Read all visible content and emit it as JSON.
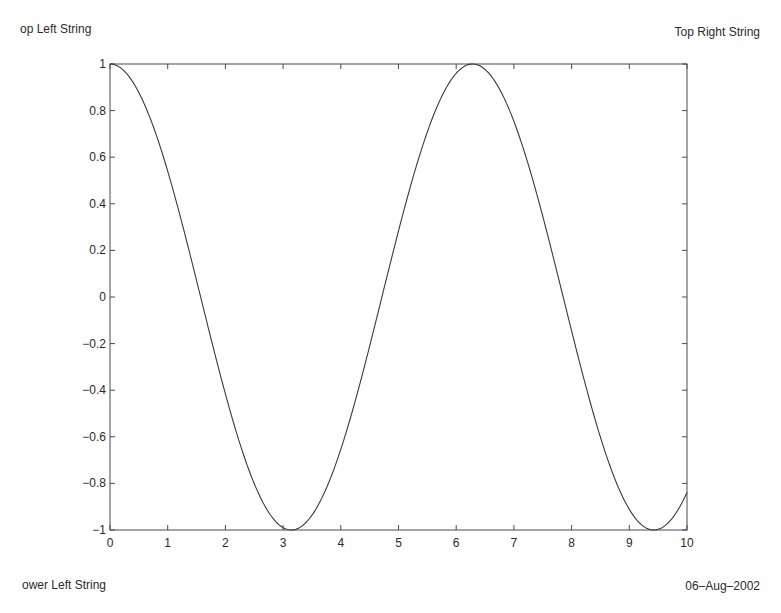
{
  "corner_labels": {
    "top_left": "op Left String",
    "top_right": "Top Right String",
    "bottom_left": "ower Left String",
    "bottom_right": "06–Aug–2002"
  },
  "colors": {
    "line": "#3a3a3a",
    "axes": "#4a4a4a",
    "text": "#2a2a2a",
    "background": "#ffffff"
  },
  "chart_data": {
    "type": "line",
    "title": "",
    "xlabel": "",
    "ylabel": "",
    "xlim": [
      0,
      10
    ],
    "ylim": [
      -1,
      1
    ],
    "grid": false,
    "legend": null,
    "x_ticks": [
      0,
      1,
      2,
      3,
      4,
      5,
      6,
      7,
      8,
      9,
      10
    ],
    "x_tick_labels": [
      "0",
      "1",
      "2",
      "3",
      "4",
      "5",
      "6",
      "7",
      "8",
      "9",
      "10"
    ],
    "y_ticks": [
      -1,
      -0.8,
      -0.6,
      -0.4,
      -0.2,
      0,
      0.2,
      0.4,
      0.6,
      0.8,
      1
    ],
    "y_tick_labels": [
      "−1",
      "−0.8",
      "−0.6",
      "−0.4",
      "−0.2",
      "0",
      "0.2",
      "0.4",
      "0.6",
      "0.8",
      "1"
    ],
    "series": [
      {
        "name": "cos(x)",
        "function": "cos",
        "x": [
          0,
          0.5,
          1,
          1.5,
          2,
          2.5,
          3,
          3.1416,
          3.5,
          4,
          4.5,
          5,
          5.5,
          6,
          6.2832,
          6.5,
          7,
          7.5,
          8,
          8.5,
          9,
          9.4248,
          9.5,
          10
        ],
        "values": [
          1,
          0.878,
          0.54,
          0.071,
          -0.416,
          -0.801,
          -0.99,
          -1,
          -0.936,
          -0.654,
          -0.211,
          0.284,
          0.709,
          0.96,
          1,
          0.977,
          0.754,
          0.347,
          -0.146,
          -0.602,
          -0.911,
          -1,
          -0.997,
          -0.839
        ]
      }
    ],
    "annotations": [
      "op Left String",
      "Top Right String",
      "ower Left String",
      "06–Aug–2002"
    ]
  }
}
